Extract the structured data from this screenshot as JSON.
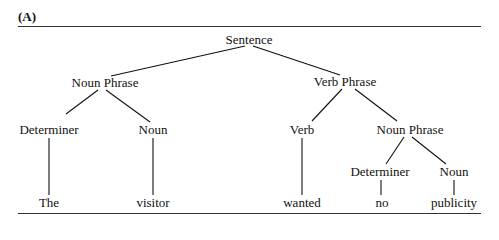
{
  "panel_label": "(A)",
  "tree": {
    "root": "Sentence",
    "nodes": [
      {
        "id": "s",
        "label": "Sentence",
        "x": 249,
        "y": 40
      },
      {
        "id": "np1",
        "label": "Noun Phrase",
        "x": 105,
        "y": 83
      },
      {
        "id": "vp",
        "label": "Verb Phrase",
        "x": 345,
        "y": 82
      },
      {
        "id": "det1",
        "label": "Determiner",
        "x": 49,
        "y": 130
      },
      {
        "id": "n1",
        "label": "Noun",
        "x": 153,
        "y": 130
      },
      {
        "id": "v",
        "label": "Verb",
        "x": 302,
        "y": 130
      },
      {
        "id": "np2",
        "label": "Noun Phrase",
        "x": 410,
        "y": 130
      },
      {
        "id": "det2",
        "label": "Determiner",
        "x": 380,
        "y": 172
      },
      {
        "id": "n2",
        "label": "Noun",
        "x": 454,
        "y": 172
      },
      {
        "id": "w1",
        "label": "The",
        "x": 49,
        "y": 203
      },
      {
        "id": "w2",
        "label": "visitor",
        "x": 153,
        "y": 203
      },
      {
        "id": "w3",
        "label": "wanted",
        "x": 302,
        "y": 203
      },
      {
        "id": "w4",
        "label": "no",
        "x": 382,
        "y": 203
      },
      {
        "id": "w5",
        "label": "publicity",
        "x": 454,
        "y": 203
      }
    ],
    "edges": [
      [
        "s",
        "np1"
      ],
      [
        "s",
        "vp"
      ],
      [
        "np1",
        "det1"
      ],
      [
        "np1",
        "n1"
      ],
      [
        "vp",
        "v"
      ],
      [
        "vp",
        "np2"
      ],
      [
        "det1",
        "w1"
      ],
      [
        "n1",
        "w2"
      ],
      [
        "v",
        "w3"
      ],
      [
        "np2",
        "det2"
      ],
      [
        "np2",
        "n2"
      ],
      [
        "det2",
        "w4"
      ],
      [
        "n2",
        "w5"
      ]
    ],
    "sentence": "The visitor wanted no publicity"
  }
}
